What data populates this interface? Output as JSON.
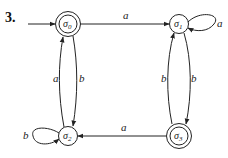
{
  "figure": {
    "number": "3."
  },
  "automaton": {
    "states": [
      {
        "id": "s0",
        "name": "σ",
        "subscript": "0",
        "accepting": true,
        "initial": true
      },
      {
        "id": "s1",
        "name": "σ",
        "subscript": "1",
        "accepting": false,
        "initial": false
      },
      {
        "id": "s2",
        "name": "σ",
        "subscript": "2",
        "accepting": false,
        "initial": false
      },
      {
        "id": "s3",
        "name": "σ",
        "subscript": "3",
        "accepting": true,
        "initial": false
      }
    ],
    "transitions": [
      {
        "from": "s0",
        "to": "s1",
        "label": "a"
      },
      {
        "from": "s1",
        "to": "s1",
        "label": "a"
      },
      {
        "from": "s2",
        "to": "s0",
        "label": "a"
      },
      {
        "from": "s0",
        "to": "s2",
        "label": "b"
      },
      {
        "from": "s2",
        "to": "s2",
        "label": "b"
      },
      {
        "from": "s3",
        "to": "s1",
        "label": "b"
      },
      {
        "from": "s1",
        "to": "s3",
        "label": "b"
      },
      {
        "from": "s3",
        "to": "s2",
        "label": "a"
      }
    ]
  }
}
